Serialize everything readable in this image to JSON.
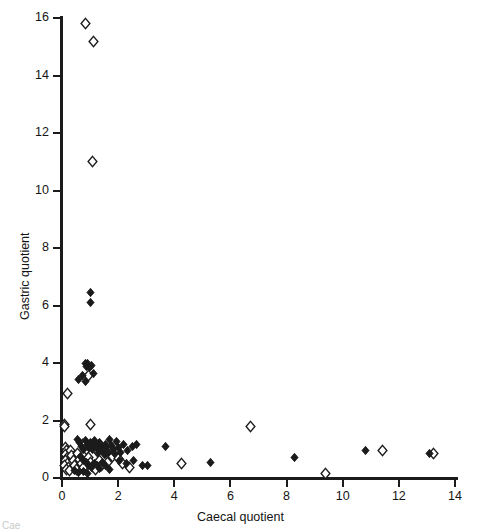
{
  "chart_data": {
    "type": "scatter",
    "title": "",
    "xlabel": "Caecal quotient",
    "ylabel": "Gastric quotient",
    "xlim": [
      0,
      14
    ],
    "ylim": [
      0,
      16
    ],
    "xticks": [
      0,
      2,
      4,
      6,
      8,
      10,
      12,
      14
    ],
    "yticks": [
      0,
      2,
      4,
      6,
      8,
      10,
      12,
      14,
      16
    ],
    "grid": false,
    "legend": "none",
    "series": [
      {
        "name": "open-diamond",
        "marker": "open diamond",
        "color": "#ffffff",
        "edge_color": "#1b1b1b",
        "points": [
          [
            0.82,
            15.82
          ],
          [
            1.12,
            15.2
          ],
          [
            1.08,
            11.0
          ],
          [
            0.95,
            3.55
          ],
          [
            0.18,
            2.95
          ],
          [
            0.1,
            1.87
          ],
          [
            0.1,
            1.78
          ],
          [
            1.0,
            1.85
          ],
          [
            0.12,
            1.05
          ],
          [
            0.15,
            0.95
          ],
          [
            0.12,
            0.82
          ],
          [
            0.18,
            0.72
          ],
          [
            0.14,
            0.62
          ],
          [
            0.2,
            0.52
          ],
          [
            0.1,
            0.45
          ],
          [
            0.22,
            0.38
          ],
          [
            0.16,
            0.3
          ],
          [
            0.28,
            0.25
          ],
          [
            0.3,
            0.95
          ],
          [
            0.35,
            0.78
          ],
          [
            0.4,
            0.6
          ],
          [
            0.45,
            0.42
          ],
          [
            0.5,
            0.3
          ],
          [
            0.55,
            0.85
          ],
          [
            0.62,
            0.66
          ],
          [
            0.7,
            0.5
          ],
          [
            0.78,
            0.35
          ],
          [
            0.72,
            1.15
          ],
          [
            0.88,
            1.0
          ],
          [
            0.95,
            0.72
          ],
          [
            1.02,
            0.55
          ],
          [
            1.1,
            0.4
          ],
          [
            1.18,
            0.28
          ],
          [
            1.25,
            0.92
          ],
          [
            1.35,
            0.62
          ],
          [
            1.42,
            0.45
          ],
          [
            1.55,
            0.9
          ],
          [
            1.62,
            0.55
          ],
          [
            1.8,
            0.75
          ],
          [
            2.0,
            0.68
          ],
          [
            2.15,
            0.52
          ],
          [
            2.42,
            0.35
          ],
          [
            4.25,
            0.52
          ],
          [
            6.7,
            1.78
          ],
          [
            9.38,
            0.15
          ],
          [
            11.4,
            0.95
          ],
          [
            13.25,
            0.85
          ]
        ]
      },
      {
        "name": "filled-diamond",
        "marker": "filled diamond",
        "color": "#1b1b1b",
        "edge_color": "#1b1b1b",
        "points": [
          [
            1.02,
            6.45
          ],
          [
            1.0,
            6.1
          ],
          [
            0.82,
            4.0
          ],
          [
            0.92,
            3.98
          ],
          [
            0.88,
            3.88
          ],
          [
            0.98,
            3.85
          ],
          [
            1.05,
            3.9
          ],
          [
            0.72,
            3.55
          ],
          [
            0.6,
            3.42
          ],
          [
            0.85,
            3.35
          ],
          [
            1.12,
            3.62
          ],
          [
            0.55,
            1.35
          ],
          [
            0.62,
            1.22
          ],
          [
            0.7,
            1.1
          ],
          [
            0.78,
            1.0
          ],
          [
            0.85,
            1.32
          ],
          [
            0.9,
            1.18
          ],
          [
            0.95,
            1.05
          ],
          [
            1.0,
            1.25
          ],
          [
            1.05,
            1.12
          ],
          [
            1.1,
            0.98
          ],
          [
            1.15,
            1.3
          ],
          [
            1.2,
            1.15
          ],
          [
            1.25,
            1.02
          ],
          [
            1.3,
            0.88
          ],
          [
            1.35,
            1.22
          ],
          [
            1.4,
            1.08
          ],
          [
            1.45,
            0.95
          ],
          [
            1.5,
            0.82
          ],
          [
            1.55,
            1.18
          ],
          [
            1.6,
            1.05
          ],
          [
            1.65,
            0.9
          ],
          [
            1.7,
            1.35
          ],
          [
            1.75,
            1.12
          ],
          [
            1.82,
            0.98
          ],
          [
            1.88,
            0.85
          ],
          [
            1.95,
            1.28
          ],
          [
            2.0,
            1.05
          ],
          [
            2.1,
            0.88
          ],
          [
            2.2,
            1.15
          ],
          [
            2.35,
            0.95
          ],
          [
            2.5,
            1.08
          ],
          [
            2.65,
            1.18
          ],
          [
            0.65,
            0.75
          ],
          [
            0.75,
            0.62
          ],
          [
            0.88,
            0.55
          ],
          [
            0.95,
            0.45
          ],
          [
            1.05,
            0.38
          ],
          [
            1.15,
            0.52
          ],
          [
            1.25,
            0.42
          ],
          [
            1.35,
            0.32
          ],
          [
            1.45,
            0.55
          ],
          [
            1.55,
            0.42
          ],
          [
            1.68,
            0.3
          ],
          [
            0.45,
            0.25
          ],
          [
            0.6,
            0.18
          ],
          [
            0.78,
            0.22
          ],
          [
            0.92,
            0.15
          ],
          [
            2.05,
            0.62
          ],
          [
            2.28,
            0.52
          ],
          [
            2.55,
            0.6
          ],
          [
            2.85,
            0.45
          ],
          [
            3.7,
            1.1
          ],
          [
            3.05,
            0.42
          ],
          [
            5.3,
            0.55
          ],
          [
            8.3,
            0.72
          ],
          [
            10.8,
            0.95
          ],
          [
            13.1,
            0.85
          ]
        ]
      }
    ]
  },
  "caption": "Cae"
}
